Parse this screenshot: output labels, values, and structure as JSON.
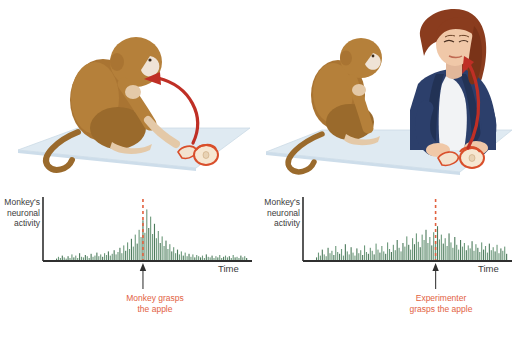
{
  "figure": {
    "background": "#ffffff",
    "accent_red": "#e2613f",
    "spike_green": "#6e9a7c",
    "spike_green_dark": "#4d7a5c",
    "axis_color": "#3b3b3b",
    "platform_color": "#dce8f0",
    "monkey_color": "#a97432",
    "apple_color": "#d94f2b",
    "blazer_color": "#2c3f6b",
    "hair_color": "#8a3c1e"
  },
  "panels": [
    {
      "id": "self-action",
      "scene": {
        "name": "monkey-grasps-apple-illustration",
        "description": "Brown monkey seated on a pale blue platform reaching toward apple slices, with a curved red arrow from the apple to the monkey's head",
        "arrow": "curved-red-arrow"
      },
      "axis": {
        "y_label": "Monkey's\nneuronal\nactivity",
        "x_label": "Time"
      },
      "event": {
        "caption": "Monkey grasps\nthe apple",
        "marker": "up-arrow",
        "dashed_line_color": "#e2613f"
      },
      "chart_data": {
        "type": "bar",
        "title": "Monkey's neuronal activity",
        "xlabel": "Time",
        "ylabel": "Monkey's neuronal activity",
        "grid": false,
        "legend": false,
        "ylim": [
          0,
          100
        ],
        "event_index": 45,
        "event_label": "Monkey grasps the apple",
        "values": [
          4,
          7,
          5,
          9,
          6,
          4,
          8,
          5,
          11,
          6,
          9,
          5,
          13,
          7,
          6,
          10,
          8,
          5,
          12,
          7,
          9,
          14,
          8,
          11,
          7,
          13,
          10,
          16,
          9,
          12,
          18,
          11,
          15,
          22,
          13,
          26,
          17,
          31,
          20,
          37,
          24,
          44,
          29,
          52,
          40,
          68,
          47,
          86,
          55,
          74,
          45,
          62,
          38,
          50,
          30,
          41,
          25,
          34,
          20,
          28,
          16,
          23,
          13,
          19,
          11,
          16,
          9,
          14,
          8,
          12,
          7,
          11,
          6,
          10,
          8,
          6,
          9,
          5,
          11,
          7,
          6,
          9,
          5,
          8,
          6,
          10,
          5,
          7,
          9,
          6,
          8,
          5,
          10,
          6,
          7,
          5,
          9,
          6,
          8,
          5
        ]
      }
    },
    {
      "id": "observed-action",
      "scene": {
        "name": "experimenter-grasps-apple-illustration",
        "description": "Monkey seated on a pale blue table watching a woman with auburn hair in a navy blazer and white top who grasps apple slices; a curved red arrow points to her face",
        "arrow": "curved-red-arrow"
      },
      "axis": {
        "y_label": "Monkey's\nneuronal\nactivity",
        "x_label": "Time"
      },
      "event": {
        "caption": "Experimenter\ngrasps the apple",
        "marker": "up-arrow",
        "dashed_line_color": "#e2613f"
      },
      "chart_data": {
        "type": "bar",
        "title": "Monkey's neuronal activity",
        "xlabel": "Time",
        "ylabel": "Monkey's neuronal activity",
        "grid": false,
        "legend": false,
        "ylim": [
          0,
          100
        ],
        "event_index": 62,
        "event_label": "Experimenter grasps the apple",
        "values": [
          6,
          14,
          9,
          19,
          11,
          8,
          22,
          13,
          17,
          10,
          25,
          15,
          12,
          20,
          9,
          28,
          16,
          11,
          23,
          14,
          9,
          21,
          13,
          18,
          10,
          26,
          15,
          12,
          22,
          17,
          11,
          29,
          19,
          14,
          25,
          16,
          12,
          31,
          20,
          15,
          27,
          18,
          35,
          22,
          16,
          30,
          24,
          41,
          27,
          19,
          38,
          28,
          46,
          32,
          23,
          44,
          35,
          52,
          30,
          40,
          26,
          48,
          33,
          58,
          36,
          44,
          29,
          38,
          25,
          46,
          31,
          22,
          40,
          27,
          19,
          35,
          24,
          30,
          18,
          26,
          21,
          33,
          17,
          28,
          22,
          15,
          31,
          19,
          25,
          14,
          29,
          18,
          23,
          16,
          27,
          13,
          21,
          17,
          24,
          12
        ]
      }
    }
  ]
}
